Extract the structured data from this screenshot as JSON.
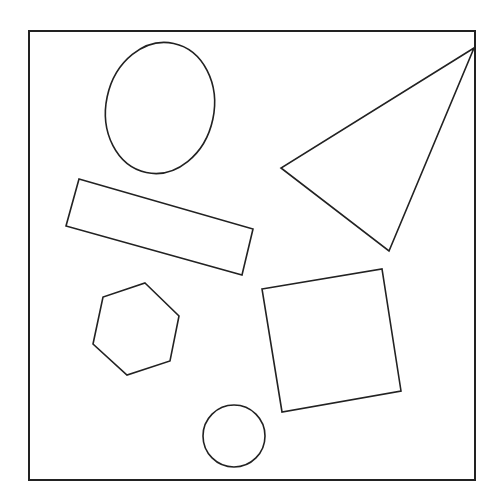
{
  "diagram": {
    "background": "#ffffff",
    "stroke_color": "#222222",
    "frame": {
      "x": 29,
      "y": 31,
      "width": 446,
      "height": 449
    },
    "shapes": [
      {
        "id": "ellipse",
        "type": "ellipse",
        "cx": 160,
        "cy": 108,
        "rx": 54,
        "ry": 66,
        "rotate": 12
      },
      {
        "id": "rectangle",
        "type": "polygon",
        "points": "79,179 253,229 242,275 66,226"
      },
      {
        "id": "triangle",
        "type": "polygon",
        "points": "474,48 281,168 389,251"
      },
      {
        "id": "hexagon",
        "type": "polygon",
        "points": "145,283 179,316 170,361 127,375 93,344 103,297"
      },
      {
        "id": "square",
        "type": "polygon",
        "points": "262,289 382,269 401,391 282,412"
      },
      {
        "id": "circle",
        "type": "circle",
        "cx": 234,
        "cy": 436,
        "r": 31
      }
    ]
  }
}
